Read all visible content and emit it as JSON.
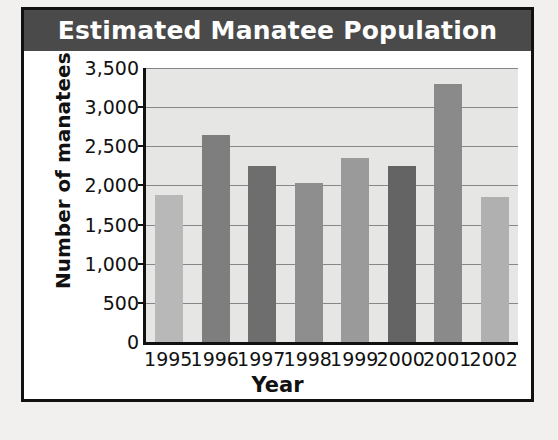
{
  "chart_data": {
    "type": "bar",
    "title": "Estimated Manatee Population",
    "xlabel": "Year",
    "ylabel": "Number of manatees",
    "categories": [
      "1995",
      "1996",
      "1997",
      "1998",
      "1999",
      "2000",
      "2001",
      "2002"
    ],
    "values": [
      1875,
      2650,
      2250,
      2025,
      2350,
      2250,
      3300,
      1850
    ],
    "bar_colors": [
      "#b8b8b8",
      "#7e7e7e",
      "#6e6e6e",
      "#8e8e8e",
      "#9a9a9a",
      "#646464",
      "#8a8a8a",
      "#b0b0b0"
    ],
    "ylim": [
      0,
      3500
    ],
    "ytick_values": [
      0,
      500,
      1000,
      1500,
      2000,
      2500,
      3000,
      3500
    ],
    "ytick_labels": [
      "0",
      "500",
      "1,000",
      "1,500",
      "2,000",
      "2,500",
      "3,000",
      "3,500"
    ],
    "grid": true,
    "legend": null,
    "plot_background": "#e6e6e4",
    "title_banner_color": "#4a4a4a",
    "title_text_color": "#ffffff",
    "axis_color": "#111111",
    "gridline_color": "#878787"
  }
}
